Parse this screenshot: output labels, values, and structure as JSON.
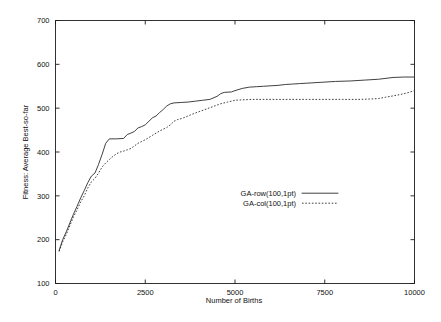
{
  "chart_data": {
    "type": "line",
    "title": "",
    "xlabel": "Number of Births",
    "ylabel": "Fitness: Average Best-so-far",
    "xlim": [
      0,
      10000
    ],
    "ylim": [
      100,
      700
    ],
    "xticks": [
      "0",
      "2500",
      "5000",
      "7500",
      "10000"
    ],
    "xtick_values": [
      0,
      2500,
      5000,
      7500,
      10000
    ],
    "yticks": [
      "100",
      "200",
      "300",
      "400",
      "500",
      "600",
      "700"
    ],
    "ytick_values": [
      100,
      200,
      300,
      400,
      500,
      600,
      700
    ],
    "grid": false,
    "legend_position": "center-right-inside",
    "series": [
      {
        "name": "GA-row(100,1pt)",
        "style": "solid",
        "x": [
          100,
          200,
          300,
          400,
          500,
          600,
          700,
          800,
          900,
          1000,
          1100,
          1200,
          1300,
          1400,
          1500,
          1700,
          1900,
          2000,
          2100,
          2200,
          2300,
          2400,
          2500,
          2600,
          2700,
          2800,
          2900,
          3000,
          3100,
          3200,
          3300,
          3500,
          3700,
          3900,
          4100,
          4300,
          4500,
          4600,
          4700,
          4900,
          5000,
          5200,
          5400,
          5600,
          5800,
          6000,
          6200,
          6400,
          6600,
          6800,
          7000,
          7400,
          7800,
          8200,
          8600,
          9000,
          9400,
          9700,
          10000
        ],
        "values": [
          175,
          200,
          218,
          238,
          258,
          276,
          295,
          312,
          330,
          345,
          352,
          372,
          395,
          420,
          430,
          430,
          431,
          440,
          443,
          447,
          455,
          458,
          462,
          470,
          478,
          482,
          490,
          497,
          505,
          510,
          512,
          513,
          514,
          516,
          518,
          520,
          527,
          533,
          536,
          537,
          540,
          545,
          548,
          549,
          550,
          551,
          552,
          554,
          555,
          556,
          557,
          559,
          561,
          562,
          564,
          566,
          570,
          571,
          571
        ]
      },
      {
        "name": "GA-col(100,1pt)",
        "style": "dotted",
        "x": [
          100,
          200,
          300,
          400,
          500,
          600,
          700,
          800,
          900,
          1000,
          1100,
          1200,
          1300,
          1400,
          1500,
          1600,
          1700,
          1800,
          1900,
          2000,
          2100,
          2200,
          2300,
          2400,
          2500,
          2600,
          2700,
          2800,
          2900,
          3000,
          3100,
          3200,
          3300,
          3400,
          3500,
          3600,
          3800,
          4000,
          4200,
          4400,
          4600,
          4800,
          5000,
          5200,
          5500,
          6000,
          6500,
          7000,
          7500,
          8000,
          8500,
          8800,
          9000,
          9200,
          9400,
          9600,
          9800,
          10000
        ],
        "values": [
          173,
          195,
          212,
          232,
          252,
          268,
          286,
          300,
          318,
          332,
          340,
          352,
          366,
          375,
          383,
          390,
          396,
          400,
          402,
          405,
          408,
          414,
          420,
          424,
          428,
          433,
          438,
          443,
          448,
          452,
          456,
          462,
          470,
          474,
          476,
          479,
          486,
          492,
          498,
          504,
          510,
          514,
          518,
          519,
          520,
          520,
          520,
          520,
          520,
          520,
          520,
          521,
          522,
          525,
          528,
          531,
          535,
          540
        ]
      }
    ]
  },
  "legend": {
    "entries": [
      {
        "label": "GA-row(100,1pt)",
        "style": "solid"
      },
      {
        "label": "GA-col(100,1pt)",
        "style": "dotted"
      }
    ]
  }
}
